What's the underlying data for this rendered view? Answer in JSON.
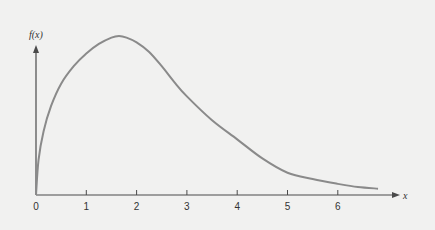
{
  "chart_data": {
    "type": "line",
    "title": "",
    "xlabel": "x",
    "ylabel": "f(x)",
    "xlim": [
      0,
      7
    ],
    "grid": false,
    "legend": "none",
    "x_ticks": [
      0,
      1,
      2,
      3,
      4,
      5,
      6
    ],
    "x_tick_labels": [
      "0",
      "1",
      "2",
      "3",
      "4",
      "5",
      "6"
    ],
    "y_ticks": [],
    "series": [
      {
        "name": "f(x)",
        "color": "#8a8a8a",
        "x": [
          0,
          0.05,
          0.15,
          0.3,
          0.5,
          0.75,
          1.0,
          1.25,
          1.5,
          1.65,
          1.8,
          2.0,
          2.25,
          2.5,
          2.75,
          3.0,
          3.5,
          4.0,
          4.5,
          5.0,
          5.5,
          6.0,
          6.4,
          6.8
        ],
        "y": [
          0,
          0.22,
          0.4,
          0.56,
          0.7,
          0.81,
          0.89,
          0.95,
          0.99,
          1.0,
          0.99,
          0.96,
          0.9,
          0.81,
          0.71,
          0.62,
          0.47,
          0.35,
          0.23,
          0.14,
          0.1,
          0.07,
          0.05,
          0.04
        ]
      }
    ],
    "ylim": [
      0,
      1.12
    ]
  }
}
